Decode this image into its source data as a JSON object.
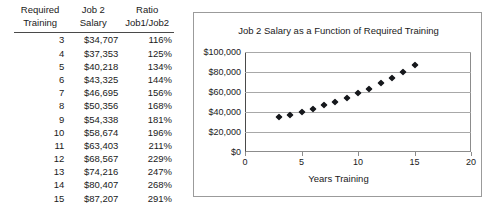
{
  "table": {
    "headers": [
      {
        "line1": "Required",
        "line2": "Training"
      },
      {
        "line1": "Job 2",
        "line2": "Salary"
      },
      {
        "line1": "Ratio",
        "line2": "Job1/Job2"
      }
    ],
    "rows": [
      {
        "training": "3",
        "salary": "$34,707",
        "ratio": "116%"
      },
      {
        "training": "4",
        "salary": "$37,353",
        "ratio": "125%"
      },
      {
        "training": "5",
        "salary": "$40,218",
        "ratio": "134%"
      },
      {
        "training": "6",
        "salary": "$43,325",
        "ratio": "144%"
      },
      {
        "training": "7",
        "salary": "$46,695",
        "ratio": "156%"
      },
      {
        "training": "8",
        "salary": "$50,356",
        "ratio": "168%"
      },
      {
        "training": "9",
        "salary": "$54,338",
        "ratio": "181%"
      },
      {
        "training": "10",
        "salary": "$58,674",
        "ratio": "196%"
      },
      {
        "training": "11",
        "salary": "$63,403",
        "ratio": "211%"
      },
      {
        "training": "12",
        "salary": "$68,567",
        "ratio": "229%"
      },
      {
        "training": "13",
        "salary": "$74,216",
        "ratio": "247%"
      },
      {
        "training": "14",
        "salary": "$80,407",
        "ratio": "268%"
      },
      {
        "training": "15",
        "salary": "$87,207",
        "ratio": "291%"
      }
    ]
  },
  "chart_data": {
    "type": "scatter",
    "title": "Job 2 Salary as a Function of Required Training",
    "xlabel": "Years Training",
    "ylabel": "",
    "x": [
      3,
      4,
      5,
      6,
      7,
      8,
      9,
      10,
      11,
      12,
      13,
      14,
      15
    ],
    "values": [
      34707,
      37353,
      40218,
      43325,
      46695,
      50356,
      54338,
      58674,
      63403,
      68567,
      74216,
      80407,
      87207
    ],
    "series": [
      {
        "name": "Job 2 Salary",
        "values": [
          34707,
          37353,
          40218,
          43325,
          46695,
          50356,
          54338,
          58674,
          63403,
          68567,
          74216,
          80407,
          87207
        ]
      }
    ],
    "xlim": [
      0,
      20
    ],
    "ylim": [
      0,
      100000
    ],
    "xticks": [
      0,
      5,
      10,
      15,
      20
    ],
    "xtick_labels": [
      "0",
      "5",
      "10",
      "15",
      "20"
    ],
    "yticks": [
      0,
      20000,
      40000,
      60000,
      80000,
      100000
    ],
    "ytick_labels": [
      "$0",
      "$20,000",
      "$40,000",
      "$60,000",
      "$80,000",
      "$100,000"
    ],
    "grid": "horizontal",
    "legend": "none",
    "marker": "diamond",
    "marker_color": "#16181c"
  },
  "colors": {
    "marker": "#16181c",
    "gridline": "#a8a8a8",
    "axis": "#4a4a4a",
    "frame": "#9b9b9b",
    "text": "#1a1a1a",
    "background": "#ffffff"
  }
}
